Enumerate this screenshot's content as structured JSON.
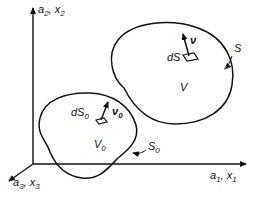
{
  "diagram": {
    "type": "continuum-mechanics-configurations",
    "axes": {
      "vertical": {
        "label_a": "a",
        "sub_a": "2",
        "label_x": "x",
        "sub_x": "2"
      },
      "horizontal": {
        "label_a": "a",
        "sub_a": "1",
        "label_x": "x",
        "sub_x": "1"
      },
      "diagonal": {
        "label_a": "a",
        "sub_a": "3",
        "label_x": "x",
        "sub_x": "3"
      }
    },
    "reference_body": {
      "volume_label": "V",
      "volume_sub": "0",
      "surface_label": "S",
      "surface_sub": "0",
      "element_label": "dS",
      "element_sub": "0",
      "normal_label": "ν",
      "normal_sub": "0"
    },
    "current_body": {
      "volume_label": "V",
      "surface_label": "S",
      "element_label": "dS",
      "normal_label": "ν"
    },
    "colors": {
      "stroke": "#111111",
      "background": "#ffffff"
    }
  }
}
